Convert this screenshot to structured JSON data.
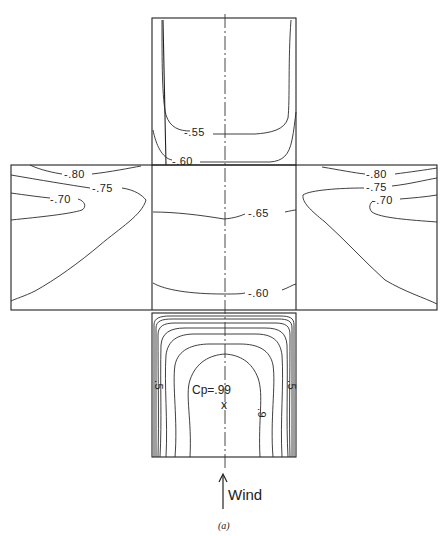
{
  "figure": {
    "caption": "(a)",
    "wind_label": "Wind",
    "faces": {
      "roof_leeward_top": {
        "contours": [
          {
            "label": "-.55"
          },
          {
            "label": "-.60"
          }
        ]
      },
      "side_left": {
        "contours": [
          {
            "label": "-.80"
          },
          {
            "label": "-.75"
          },
          {
            "label": "-.70"
          }
        ]
      },
      "side_right": {
        "contours": [
          {
            "label": "-.80"
          },
          {
            "label": "-.75"
          },
          {
            "label": "-.70"
          }
        ]
      },
      "roof_center": {
        "contours": [
          {
            "label": "-.65"
          },
          {
            "label": "-.60"
          }
        ]
      },
      "windward": {
        "peak_label": "Cp=.99",
        "peak_marker": "x",
        "contours": [
          {
            "label": ".9"
          },
          {
            "label": ".5"
          },
          {
            "label": ".5"
          }
        ]
      }
    }
  }
}
